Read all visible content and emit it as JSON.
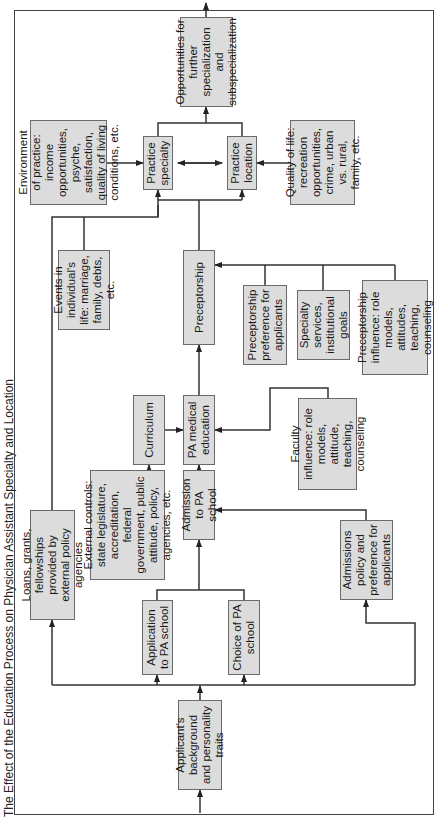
{
  "title": "The Effect of the Education Process on Physician Assistant Specialty and Location",
  "boxes": {
    "applicant": "Applicant's background and personality traits",
    "application": "Application to PA school",
    "choice": "Choice of PA school",
    "loans": "Loans, grants, fellowships provided by external policy agencies",
    "admission": "Admission to PA school",
    "admissions_policy": "Admissions policy and preference for applicants",
    "external_controls": "External controls: state legislature, accreditation, federal government, public attitude, policy, agencies, etc.",
    "curriculum": "Curriculum",
    "pa_medical_education": "PA medical education",
    "faculty_influence": "Faculty influence: role models, attitude, teaching, counseling",
    "preceptorship": "Preceptorship",
    "preceptorship_preference": "Preceptorship preference for applicants",
    "specialty_services": "Specialty services, institutional goals",
    "preceptorship_influence": "Preceptorship influence: role models, attitudes, teaching, counseling",
    "events": "Events in individual's life: marriage, family, debts, etc.",
    "environment": "Environment of practice: income opportunities, psyche, satisfaction, quality of living conditions, etc.",
    "practice_specialty": "Practice specialty",
    "practice_location": "Practice location",
    "quality_of_life": "Quality of life: recreation opportunities, crime, urban vs. rural, family, etc.",
    "opportunities": "Opportunities for further specialization and subspecialization"
  },
  "colors": {
    "box_fill": "#dcdcdc",
    "box_border": "#6a6a6a",
    "line": "#333333"
  }
}
